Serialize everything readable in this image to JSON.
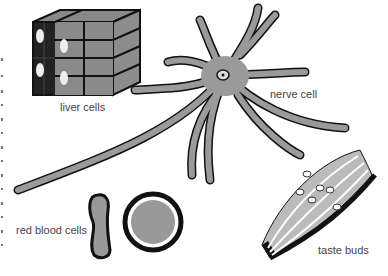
{
  "figure": {
    "labels": {
      "liver": "liver cells",
      "nerve": "nerve cell",
      "red_blood": "red blood cells",
      "taste": "taste buds"
    },
    "colors": {
      "cell_gray": "#9a9a9a",
      "outline": "#111111",
      "label_text": "#444444",
      "background": "#ffffff"
    }
  }
}
